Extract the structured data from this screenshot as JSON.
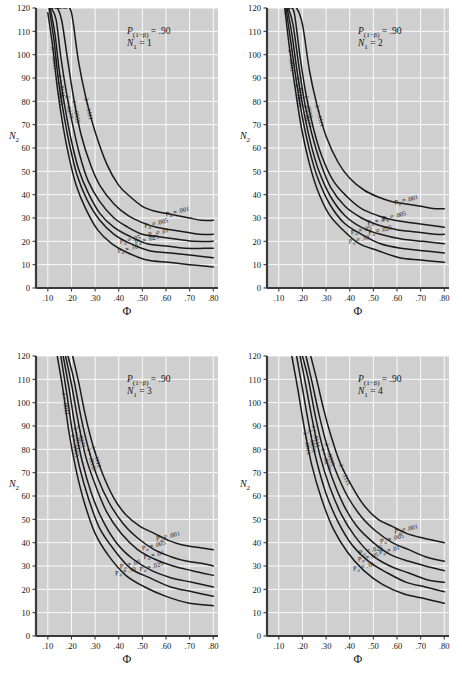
{
  "figure": {
    "background": "#ffffff",
    "panel_background": "#cfcfcf",
    "grid_color": "#ffffff",
    "curve_color": "#1a1a1a",
    "axis_color": "#3a3a3a",
    "text_color": "#141414"
  },
  "common": {
    "xlabel": "Φ",
    "ylabel": "N₂",
    "power_label_prefix": "P",
    "power_label_sub": "(1−β)",
    "power_label_value": "= .90",
    "n1_prefix": "N",
    "n1_sub": "1",
    "xticks": [
      ".10",
      ".20",
      ".30",
      ".40",
      ".50",
      ".60",
      ".70",
      ".80"
    ],
    "xtick_values": [
      0.1,
      0.2,
      0.3,
      0.4,
      0.5,
      0.6,
      0.7,
      0.8
    ],
    "yticks": [
      "0",
      "10",
      "20",
      "30",
      "40",
      "50",
      "60",
      "70",
      "80",
      "90",
      "100",
      "110",
      "120"
    ],
    "ytick_values": [
      0,
      10,
      20,
      30,
      40,
      50,
      60,
      70,
      80,
      90,
      100,
      110,
      120
    ],
    "xlim": [
      0.05,
      0.82
    ],
    "ylim": [
      0,
      120
    ],
    "alpha_labels": [
      "Pα = .001",
      "Pα = .005",
      "Pα = .01",
      "Pα = .025",
      "Pα = .05",
      "Pα = .10"
    ],
    "alpha_values": [
      ".001",
      ".005",
      ".01",
      ".025",
      ".05",
      ".10"
    ],
    "lambda_labels": [
      "λ = .1111",
      "λ = .0555",
      "λ = .0277",
      "λ = .0111",
      "λ = .0055",
      "λ = .0011"
    ],
    "lambda_values": [
      ".1111",
      ".0555",
      ".0277",
      ".0111",
      ".0055",
      ".0011"
    ],
    "alpha_symbol": "P",
    "alpha_sub": "α",
    "lambda_symbol": "λ"
  },
  "chart_data": {
    "type": "line",
    "xlabel": "Φ",
    "ylabel": "N₂",
    "xlim": [
      0.05,
      0.82
    ],
    "ylim": [
      0,
      120
    ],
    "grid": true,
    "legend": "inline curve annotations",
    "panels": [
      {
        "id": "panel-n1-1",
        "position": "top-left",
        "power": ".90",
        "n1": "1",
        "annotation": "P(1−β) = .90 ; N1 = 1",
        "series": [
          {
            "name": "Pα = .001",
            "lambda": ".0011",
            "x": [
              0.13,
              0.15,
              0.175,
              0.2,
              0.23,
              0.26,
              0.3,
              0.35,
              0.4,
              0.45,
              0.5,
              0.55,
              0.6,
              0.65,
              0.7,
              0.75,
              0.8
            ],
            "y": [
              120,
              120,
              120,
              118,
              97,
              82,
              67,
              53,
              44,
              39,
              35,
              33,
              32,
              31,
              30,
              29,
              29
            ]
          },
          {
            "name": "Pα = .005",
            "lambda": ".0055",
            "x": [
              0.12,
              0.14,
              0.16,
              0.185,
              0.21,
              0.24,
              0.28,
              0.32,
              0.38,
              0.44,
              0.5,
              0.56,
              0.62,
              0.68,
              0.74,
              0.8
            ],
            "y": [
              120,
              120,
              114,
              97,
              81,
              66,
              53,
              44,
              36,
              31,
              28,
              26,
              25,
              24,
              23,
              23
            ]
          },
          {
            "name": "Pα = .01",
            "lambda": ".0111",
            "x": [
              0.115,
              0.135,
              0.155,
              0.18,
              0.205,
              0.235,
              0.27,
              0.32,
              0.38,
              0.44,
              0.5,
              0.57,
              0.64,
              0.72,
              0.8
            ],
            "y": [
              120,
              115,
              99,
              83,
              70,
              57,
              46,
              37,
              30,
              26,
              23,
              22,
              21,
              20,
              20
            ]
          },
          {
            "name": "Pα = .025",
            "lambda": ".0277",
            "x": [
              0.11,
              0.13,
              0.15,
              0.175,
              0.2,
              0.23,
              0.27,
              0.32,
              0.38,
              0.45,
              0.52,
              0.6,
              0.68,
              0.76,
              0.8
            ],
            "y": [
              120,
              109,
              92,
              76,
              63,
              51,
              41,
              32,
              26,
              22,
              19,
              18,
              17,
              17,
              17
            ]
          },
          {
            "name": "Pα = .05",
            "lambda": ".0555",
            "x": [
              0.105,
              0.125,
              0.145,
              0.17,
              0.195,
              0.225,
              0.265,
              0.32,
              0.38,
              0.45,
              0.53,
              0.62,
              0.71,
              0.8
            ],
            "y": [
              120,
              107,
              89,
              73,
              60,
              48,
              38,
              29,
              23,
              19,
              16,
              15,
              14,
              13
            ]
          },
          {
            "name": "Pα = .10",
            "lambda": ".1111",
            "x": [
              0.1,
              0.12,
              0.14,
              0.165,
              0.19,
              0.22,
              0.26,
              0.31,
              0.37,
              0.44,
              0.52,
              0.61,
              0.7,
              0.8
            ],
            "y": [
              118,
              104,
              86,
              69,
              56,
              44,
              34,
              25,
              19,
              15,
              12,
              11,
              10,
              9
            ]
          }
        ]
      },
      {
        "id": "panel-n1-2",
        "position": "top-right",
        "power": ".90",
        "n1": "2",
        "annotation": "P(1−β) = .90 ; N1 = 2",
        "series": [
          {
            "name": "Pα = .001",
            "lambda": ".0011",
            "x": [
              0.155,
              0.175,
              0.2,
              0.23,
              0.26,
              0.3,
              0.35,
              0.4,
              0.46,
              0.52,
              0.58,
              0.64,
              0.7,
              0.76,
              0.8
            ],
            "y": [
              120,
              120,
              113,
              93,
              79,
              65,
              54,
              47,
              42,
              39,
              37,
              36,
              35,
              34,
              34
            ]
          },
          {
            "name": "Pα = .005",
            "lambda": ".0055",
            "x": [
              0.145,
              0.165,
              0.19,
              0.215,
              0.245,
              0.28,
              0.33,
              0.39,
              0.45,
              0.52,
              0.59,
              0.66,
              0.73,
              0.8
            ],
            "y": [
              120,
              118,
              99,
              83,
              69,
              57,
              46,
              39,
              34,
              31,
              29,
              28,
              27,
              26
            ]
          },
          {
            "name": "Pα = .01",
            "lambda": ".0111",
            "x": [
              0.14,
              0.16,
              0.185,
              0.21,
              0.24,
              0.275,
              0.32,
              0.38,
              0.45,
              0.52,
              0.6,
              0.68,
              0.76,
              0.8
            ],
            "y": [
              120,
              113,
              95,
              79,
              66,
              54,
              43,
              35,
              30,
              27,
              25,
              24,
              23,
              23
            ]
          },
          {
            "name": "Pα = .025",
            "lambda": ".0277",
            "x": [
              0.135,
              0.155,
              0.18,
              0.205,
              0.235,
              0.27,
              0.32,
              0.38,
              0.45,
              0.53,
              0.62,
              0.71,
              0.8
            ],
            "y": [
              120,
              109,
              91,
              76,
              62,
              50,
              39,
              31,
              26,
              23,
              21,
              20,
              19
            ]
          },
          {
            "name": "Pα = .05",
            "lambda": ".0555",
            "x": [
              0.13,
              0.15,
              0.175,
              0.2,
              0.23,
              0.265,
              0.315,
              0.375,
              0.45,
              0.53,
              0.62,
              0.71,
              0.8
            ],
            "y": [
              120,
              106,
              88,
              73,
              59,
              47,
              36,
              28,
              23,
              19,
              17,
              16,
              15
            ]
          },
          {
            "name": "Pα = .10",
            "lambda": ".1111",
            "x": [
              0.125,
              0.145,
              0.17,
              0.195,
              0.225,
              0.26,
              0.31,
              0.37,
              0.44,
              0.52,
              0.61,
              0.7,
              0.8
            ],
            "y": [
              120,
              103,
              85,
              69,
              55,
              43,
              32,
              25,
              19,
              16,
              13,
              12,
              11
            ]
          }
        ]
      },
      {
        "id": "panel-n1-3",
        "position": "bottom-left",
        "power": ".90",
        "n1": "3",
        "annotation": "P(1−β) = .90 ; N1 = 3",
        "series": [
          {
            "name": "Pα = .001",
            "lambda": ".0011",
            "x": [
              0.205,
              0.23,
              0.26,
              0.29,
              0.33,
              0.38,
              0.43,
              0.49,
              0.55,
              0.61,
              0.67,
              0.73,
              0.8
            ],
            "y": [
              120,
              109,
              94,
              82,
              70,
              59,
              52,
              47,
              44,
              41,
              39,
              38,
              37
            ]
          },
          {
            "name": "Pα = .005",
            "lambda": ".0055",
            "x": [
              0.185,
              0.21,
              0.24,
              0.27,
              0.31,
              0.36,
              0.42,
              0.48,
              0.55,
              0.62,
              0.69,
              0.76,
              0.8
            ],
            "y": [
              120,
              110,
              94,
              81,
              68,
              57,
              48,
              42,
              37,
              34,
              32,
              31,
              30
            ]
          },
          {
            "name": "Pα = .01",
            "lambda": ".0111",
            "x": [
              0.175,
              0.2,
              0.23,
              0.26,
              0.3,
              0.35,
              0.41,
              0.48,
              0.55,
              0.63,
              0.71,
              0.8
            ],
            "y": [
              120,
              108,
              91,
              77,
              65,
              53,
              44,
              37,
              33,
              30,
              28,
              26
            ]
          },
          {
            "name": "Pα = .025",
            "lambda": ".0277",
            "x": [
              0.165,
              0.19,
              0.215,
              0.245,
              0.285,
              0.33,
              0.39,
              0.46,
              0.54,
              0.62,
              0.71,
              0.8
            ],
            "y": [
              120,
              106,
              90,
              75,
              61,
              50,
              40,
              33,
              28,
              25,
              23,
              21
            ]
          },
          {
            "name": "Pα = .05",
            "lambda": ".0555",
            "x": [
              0.155,
              0.18,
              0.205,
              0.235,
              0.275,
              0.32,
              0.38,
              0.45,
              0.53,
              0.62,
              0.71,
              0.8
            ],
            "y": [
              120,
              104,
              87,
              72,
              58,
              46,
              37,
              29,
              25,
              21,
              19,
              17
            ]
          },
          {
            "name": "Pα = .10",
            "lambda": ".1111",
            "x": [
              0.14,
              0.165,
              0.19,
              0.22,
              0.255,
              0.3,
              0.36,
              0.43,
              0.51,
              0.6,
              0.7,
              0.8
            ],
            "y": [
              120,
              105,
              87,
              71,
              57,
              44,
              34,
              26,
              21,
              17,
              14,
              13
            ]
          }
        ]
      },
      {
        "id": "panel-n1-4",
        "position": "bottom-right",
        "power": ".90",
        "n1": "4",
        "annotation": "P(1−β) = .90 ; N1 = 4",
        "series": [
          {
            "name": "Pα = .001",
            "lambda": ".0011",
            "x": [
              0.235,
              0.26,
              0.29,
              0.32,
              0.36,
              0.41,
              0.46,
              0.52,
              0.58,
              0.64,
              0.71,
              0.8
            ],
            "y": [
              120,
              110,
              97,
              86,
              74,
              64,
              56,
              50,
              47,
              44,
              42,
              40
            ]
          },
          {
            "name": "Pα = .005",
            "lambda": ".0055",
            "x": [
              0.215,
              0.24,
              0.27,
              0.3,
              0.34,
              0.39,
              0.45,
              0.51,
              0.58,
              0.65,
              0.72,
              0.8
            ],
            "y": [
              120,
              109,
              95,
              83,
              71,
              60,
              51,
              45,
              40,
              37,
              34,
              32
            ]
          },
          {
            "name": "Pα = .01",
            "lambda": ".0111",
            "x": [
              0.2,
              0.225,
              0.255,
              0.285,
              0.325,
              0.375,
              0.43,
              0.5,
              0.57,
              0.65,
              0.72,
              0.8
            ],
            "y": [
              120,
              110,
              94,
              81,
              68,
              56,
              47,
              40,
              35,
              32,
              30,
              28
            ]
          },
          {
            "name": "Pα = .025",
            "lambda": ".0277",
            "x": [
              0.19,
              0.215,
              0.245,
              0.275,
              0.315,
              0.365,
              0.42,
              0.49,
              0.57,
              0.65,
              0.73,
              0.8
            ],
            "y": [
              120,
              107,
              91,
              77,
              64,
              52,
              43,
              35,
              30,
              27,
              24,
              23
            ]
          },
          {
            "name": "Pα = .05",
            "lambda": ".0555",
            "x": [
              0.175,
              0.2,
              0.23,
              0.26,
              0.3,
              0.35,
              0.41,
              0.48,
              0.56,
              0.64,
              0.72,
              0.8
            ],
            "y": [
              120,
              106,
              89,
              75,
              61,
              49,
              39,
              32,
              27,
              23,
              21,
              19
            ]
          },
          {
            "name": "Pα = .10",
            "lambda": ".1111",
            "x": [
              0.155,
              0.18,
              0.21,
              0.24,
              0.28,
              0.33,
              0.39,
              0.46,
              0.54,
              0.63,
              0.72,
              0.8
            ],
            "y": [
              120,
              106,
              88,
              73,
              59,
              46,
              36,
              28,
              22,
              18,
              16,
              14
            ]
          }
        ]
      }
    ]
  }
}
